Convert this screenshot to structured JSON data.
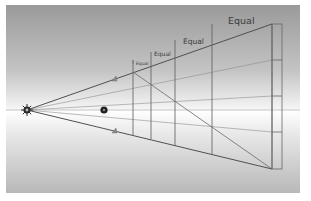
{
  "diagram": {
    "type": "one-point perspective construction",
    "labels": [
      {
        "text": "Equal",
        "size": "xs"
      },
      {
        "text": "Equal",
        "size": "s"
      },
      {
        "text": "Equal",
        "size": "m"
      },
      {
        "text": "Equal",
        "size": "l"
      }
    ],
    "markers": {
      "vanishing_point": "vanishing-point-sun-icon",
      "eye_point": "eye-point-dot-icon",
      "upper_arrow": "upper-arrow-marker-icon",
      "lower_arrow": "lower-arrow-marker-icon"
    },
    "colors": {
      "line": "#4a4a4a",
      "guide": "#8a8a8a",
      "horizon": "#b0b0b0"
    }
  }
}
